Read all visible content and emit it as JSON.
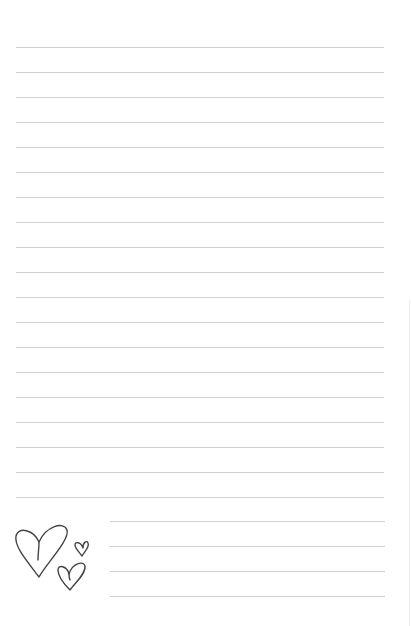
{
  "page": {
    "type": "lined-notepaper",
    "background": "#ffffff",
    "rule_color": "#cfcfcf",
    "full_lines": {
      "count": 19,
      "first_y": 47,
      "spacing": 25,
      "x_start": 16,
      "x_end": 384
    },
    "short_lines": {
      "count": 4,
      "first_y": 521,
      "spacing": 25,
      "x_start": 110,
      "x_end": 385
    },
    "decoration": {
      "icon": "hearts-icon",
      "hearts": 3,
      "stroke_color": "#444444"
    }
  }
}
